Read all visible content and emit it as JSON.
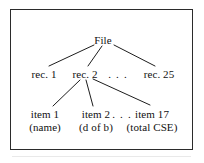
{
  "figure": {
    "background_color": "#ffffff",
    "frame_color": "#2b2b2b",
    "text_color": "#111111"
  },
  "tree": {
    "root": {
      "label": "File",
      "x": 103,
      "y": 40
    },
    "record_level": {
      "ellipsis": ". . .",
      "ellipsis_x": 118,
      "y": 74,
      "nodes": [
        {
          "label": "rec. 1",
          "x": 44
        },
        {
          "label": "rec. 2",
          "x": 85
        },
        {
          "label": "rec. 25",
          "x": 159
        }
      ]
    },
    "item_level": {
      "ellipsis": ". . .",
      "ellipsis_x": 122,
      "y": 114,
      "nodes": [
        {
          "label": "item 1",
          "sublabel": "(name)",
          "x": 45
        },
        {
          "label": "item 2",
          "sublabel": "(d of b)",
          "x": 96
        },
        {
          "label": "item 17",
          "sublabel": "(total CSE)",
          "x": 152
        }
      ]
    },
    "edges": [
      {
        "from": "File",
        "to": "rec. 1",
        "x1": 94,
        "y1": 45,
        "x2": 49,
        "y2": 66
      },
      {
        "from": "File",
        "to": "rec. 2",
        "x1": 102,
        "y1": 46,
        "x2": 88,
        "y2": 66
      },
      {
        "from": "File",
        "to": "rec. 25",
        "x1": 114,
        "y1": 45,
        "x2": 155,
        "y2": 66
      },
      {
        "from": "rec. 2",
        "to": "item 1",
        "x1": 80,
        "y1": 80,
        "x2": 53,
        "y2": 106
      },
      {
        "from": "rec. 2",
        "to": "item 2",
        "x1": 86,
        "y1": 80,
        "x2": 93,
        "y2": 106
      },
      {
        "from": "rec. 2",
        "to": "item 17",
        "x1": 93,
        "y1": 79,
        "x2": 150,
        "y2": 105
      }
    ]
  }
}
